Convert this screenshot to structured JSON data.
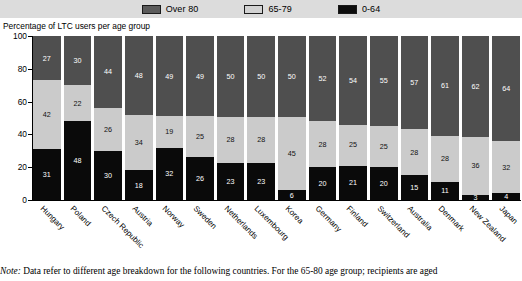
{
  "legend": {
    "items": [
      {
        "label": "Over 80",
        "color": "#4f4f4f",
        "key": "over_80"
      },
      {
        "label": "65-79",
        "color": "#cbcbcb",
        "key": "age_65_79"
      },
      {
        "label": "0-64",
        "color": "#0a0a0a",
        "key": "age_0_64"
      }
    ]
  },
  "axis_title": "Percentage of LTC users per age group",
  "footnote": {
    "lead": "Note:",
    "text": "Data refer to different age breakdown for the following countries. For the 65-80 age group; recipients are aged"
  },
  "chart_data": {
    "type": "bar",
    "subtype": "stacked-percentage-column",
    "title": "Percentage of LTC users per age group",
    "xlabel": "",
    "ylabel": "Percentage of LTC users per age group",
    "ylim": [
      0,
      100
    ],
    "yticks": [
      0,
      20,
      40,
      60,
      80,
      100
    ],
    "grid": false,
    "legend_position": "top-center",
    "stack_order_bottom_to_top": [
      "0-64",
      "65-79",
      "Over 80"
    ],
    "categories": [
      "Hungary",
      "Poland",
      "Czech Republic",
      "Austria",
      "Norway",
      "Sweden",
      "Netherlands",
      "Luxembourg",
      "Korea",
      "Germany",
      "Finland",
      "Switzerland",
      "Australia",
      "Denmark",
      "New Zealand",
      "Japan"
    ],
    "series": [
      {
        "name": "0-64",
        "color": "#0a0a0a",
        "values": [
          31,
          48,
          30,
          18,
          32,
          26,
          23,
          23,
          6,
          20,
          21,
          20,
          15,
          11,
          3,
          4
        ]
      },
      {
        "name": "65-79",
        "color": "#cbcbcb",
        "values": [
          42,
          22,
          26,
          34,
          19,
          25,
          28,
          28,
          45,
          28,
          25,
          25,
          28,
          28,
          36,
          32
        ]
      },
      {
        "name": "Over 80",
        "color": "#4f4f4f",
        "values": [
          27,
          30,
          44,
          48,
          49,
          49,
          50,
          50,
          50,
          52,
          54,
          55,
          57,
          61,
          62,
          64
        ]
      }
    ]
  }
}
